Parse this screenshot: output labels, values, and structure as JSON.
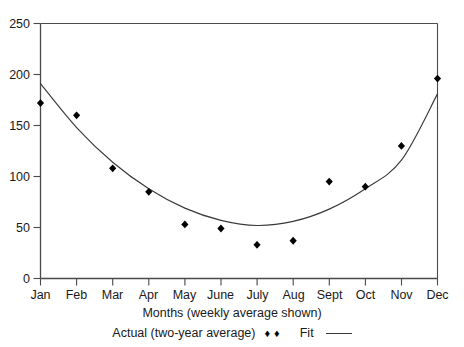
{
  "chart_data": {
    "type": "scatter",
    "title": "",
    "xlabel": "Months (weekly average shown)",
    "ylabel": "",
    "categories": [
      "Jan",
      "Feb",
      "Mar",
      "Apr",
      "May",
      "June",
      "July",
      "Aug",
      "Sept",
      "Oct",
      "Nov",
      "Dec"
    ],
    "ylim": [
      0,
      250
    ],
    "yticks": [
      0,
      50,
      100,
      150,
      200,
      250
    ],
    "ytick_labels": [
      "0",
      "50",
      "100",
      "150",
      "200",
      "250"
    ],
    "grid": false,
    "legend_position": "below-axis",
    "series": [
      {
        "name": "Actual (two-year average)",
        "marker": "diamond",
        "style": "points",
        "values": [
          172,
          160,
          108,
          85,
          53,
          49,
          33,
          37,
          95,
          90,
          130,
          196
        ]
      },
      {
        "name": "Fit",
        "marker": "none",
        "style": "line",
        "values": [
          191,
          148,
          114,
          88,
          69,
          57,
          52,
          56,
          68,
          88,
          116,
          181
        ]
      }
    ]
  },
  "legend": {
    "actual_label": "Actual (two-year average)",
    "fit_label": "Fit",
    "marker_glyph": "♦"
  },
  "axes": {
    "x_title": "Months (weekly average shown)"
  },
  "colors": {
    "axis": "#4a4a4a",
    "marker": "#000000",
    "fit_line": "#3a3a3a",
    "text": "#1a1a1a",
    "background": "#ffffff"
  }
}
